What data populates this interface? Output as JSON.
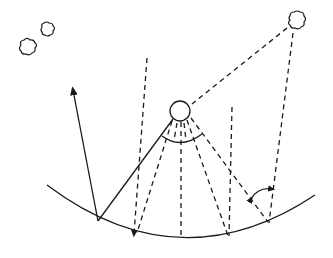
{
  "diagram": {
    "type": "radiation-geometry-schematic",
    "labels": [],
    "colors": {
      "stroke": "#1a1a1a",
      "background": "#ffffff"
    },
    "elements": {
      "clouds": [
        {
          "name": "cloud-left-small-lower",
          "cx": 27,
          "cy": 50
        },
        {
          "name": "cloud-left-small-upper",
          "cx": 47,
          "cy": 31
        },
        {
          "name": "cloud-top-right",
          "cx": 296,
          "cy": 22
        }
      ],
      "sun": {
        "cx": 180,
        "cy": 111,
        "r": 10
      },
      "surface": {
        "shape": "concave-arc",
        "from": [
          47,
          185
        ],
        "to": [
          315,
          195
        ],
        "lowest": [
          180,
          236
        ]
      },
      "reflected_ray": {
        "from": [
          98,
          221
        ],
        "to": [
          72,
          88
        ],
        "arrowhead": true
      },
      "incident_ray": {
        "from": [
          172,
          120
        ],
        "to": [
          98,
          221
        ]
      },
      "view_angle_arc": {
        "center": [
          180,
          111
        ],
        "from": [
          163,
          137
        ],
        "to": [
          201,
          137
        ]
      },
      "zenith_angle_arrow": {
        "from": [
          250,
          200
        ],
        "to": [
          272,
          189
        ],
        "double_headed": true
      }
    }
  }
}
